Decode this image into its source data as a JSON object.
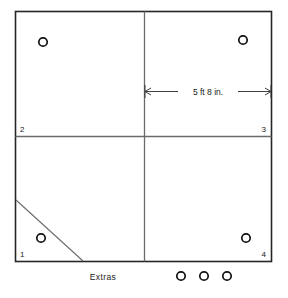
{
  "diagram": {
    "stroke_color": "#262626",
    "interior_stroke_color": "#6b6b6b",
    "background_color": "#ffffff",
    "frame": {
      "x": 15,
      "y": 11,
      "width": 257,
      "height": 251
    },
    "interior_lines": {
      "vertical_x": 144,
      "horizontal_y": 136
    },
    "corner_labels": [
      {
        "text": "2",
        "x": 20,
        "y": 132,
        "name": "corner-label-2"
      },
      {
        "text": "3",
        "x": 262,
        "y": 132,
        "name": "corner-label-3"
      },
      {
        "text": "1",
        "x": 20,
        "y": 257,
        "name": "corner-label-1"
      },
      {
        "text": "4",
        "x": 262,
        "y": 257,
        "name": "corner-label-4"
      }
    ],
    "holes": [
      {
        "cx": 43,
        "cy": 42,
        "r": 4.2,
        "name": "hole-top-left"
      },
      {
        "cx": 243,
        "cy": 40,
        "r": 4.2,
        "name": "hole-top-right"
      },
      {
        "cx": 41,
        "cy": 238,
        "r": 4.2,
        "name": "hole-bottom-left"
      },
      {
        "cx": 246,
        "cy": 238,
        "r": 4.2,
        "name": "hole-bottom-right"
      }
    ],
    "diagonal_cut": {
      "x1": 16,
      "y1": 200,
      "x2": 83,
      "y2": 261,
      "name": "diagonal-cut-line"
    },
    "dimension": {
      "label": "5 ft 8 in.",
      "y": 91,
      "x_start": 144,
      "x_end": 272,
      "label_x": 208,
      "label_y": 94
    },
    "extras": {
      "label": "Extras",
      "label_x": 103,
      "label_y": 280,
      "holes": [
        {
          "cx": 181,
          "cy": 276,
          "r": 4.2,
          "name": "extras-hole-1"
        },
        {
          "cx": 204,
          "cy": 276,
          "r": 4.2,
          "name": "extras-hole-2"
        },
        {
          "cx": 227,
          "cy": 276,
          "r": 4.2,
          "name": "extras-hole-3"
        }
      ]
    }
  }
}
